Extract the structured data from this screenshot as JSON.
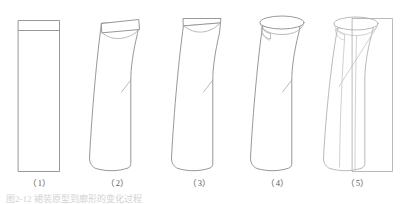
{
  "figure": {
    "background_color": "#ffffff",
    "line_color": "#8c8c8c",
    "soft_line_color": "#a8a8a8",
    "faint_line_color": "#bdbdbd",
    "caption_color": "#5a5a5a",
    "title_text": "图2-12  裙装原型到廓形的变化过程",
    "panels": [
      {
        "id": "panel-1",
        "label": "（1）",
        "description": "rectangular block with waistband line"
      },
      {
        "id": "panel-2",
        "label": "（2）",
        "description": "tapered silhouette with flat waistband and curved yoke"
      },
      {
        "id": "panel-3",
        "label": "（3）",
        "description": "tapered silhouette with slanted waistband"
      },
      {
        "id": "panel-4",
        "label": "（4）",
        "description": "silhouette with elliptical waist opening and pocket detail"
      },
      {
        "id": "panel-5",
        "label": "（5）",
        "description": "finished silhouette with overlay construction rectangle"
      }
    ]
  }
}
